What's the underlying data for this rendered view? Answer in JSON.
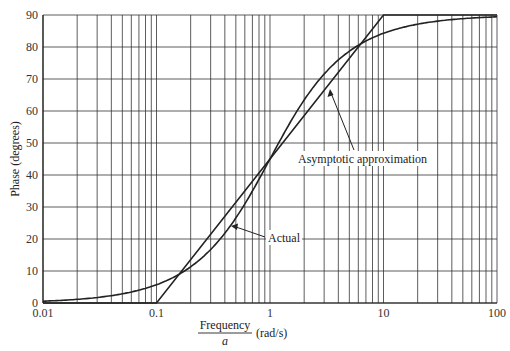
{
  "chart_data": {
    "type": "line",
    "title": "",
    "xlabel_numerator": "Frequency",
    "xlabel_denominator": "a",
    "xlabel_units": "(rad/s)",
    "ylabel": "Phase (degrees)",
    "xscale": "log",
    "xlim": [
      0.01,
      100
    ],
    "ylim": [
      0,
      90
    ],
    "grid": true,
    "x_ticks": [
      "0.01",
      "0.1",
      "1",
      "10",
      "100"
    ],
    "y_ticks": [
      "0",
      "10",
      "20",
      "30",
      "40",
      "50",
      "60",
      "70",
      "80",
      "90"
    ],
    "series": [
      {
        "name": "Actual",
        "x": [
          0.01,
          0.02,
          0.05,
          0.1,
          0.2,
          0.5,
          1,
          2,
          5,
          10,
          20,
          50,
          100
        ],
        "y": [
          0.6,
          1.1,
          2.9,
          5.7,
          11.3,
          26.6,
          45.0,
          63.4,
          78.7,
          84.3,
          87.1,
          88.9,
          89.4
        ]
      },
      {
        "name": "Asymptotic approximation",
        "x": [
          0.01,
          0.1,
          1,
          10,
          100
        ],
        "y": [
          0,
          0,
          45,
          90,
          90
        ]
      }
    ],
    "annotations": [
      {
        "text": "Asymptotic approximation",
        "points_to": "Asymptotic approximation",
        "x_at": 3.2,
        "y_at": 67
      },
      {
        "text": "Actual",
        "points_to": "Actual",
        "x_at": 0.5,
        "y_at": 24
      }
    ],
    "legend": "none (inline annotations with arrows)"
  }
}
